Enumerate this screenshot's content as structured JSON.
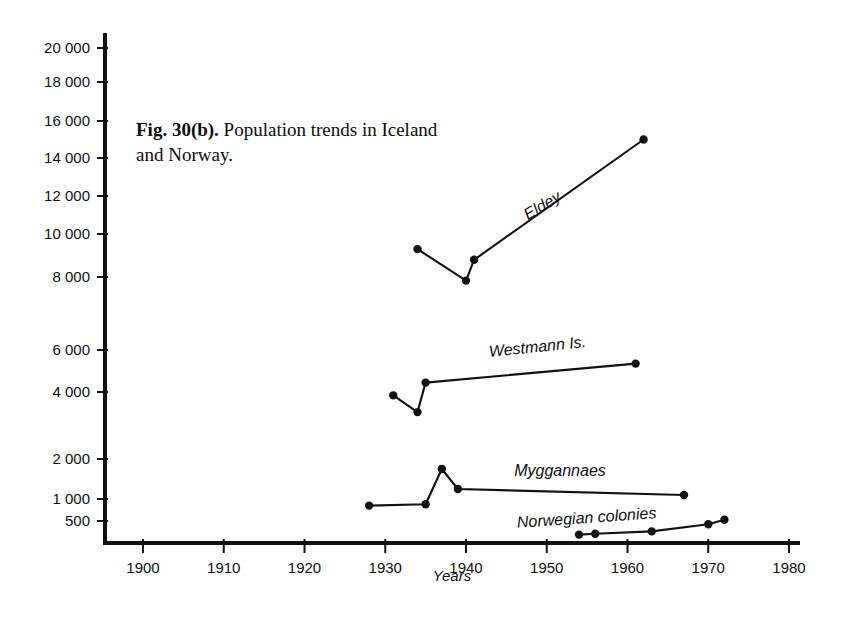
{
  "caption": {
    "figure_number": "Fig. 30(b).",
    "text": " Population trends in Iceland and Norway."
  },
  "chart_data": {
    "type": "line",
    "title": "Fig. 30(b). Population trends in Iceland and Norway.",
    "xlabel": "Years",
    "ylabel": "",
    "xlim": [
      1895,
      1980
    ],
    "ylim": [
      300,
      21000
    ],
    "grid": false,
    "legend": "inline-labels",
    "y_axis_note": "non-linear below 2 000 (500, 1 000, 2 000 compressed)",
    "xticks": [
      1900,
      1910,
      1920,
      1930,
      1940,
      1950,
      1960,
      1970,
      1980
    ],
    "xticklabels": [
      "1900",
      "1910",
      "1920",
      "1930",
      "1940",
      "1950",
      "1960",
      "1970",
      "1980"
    ],
    "yticks": [
      500,
      1000,
      2000,
      4000,
      6000,
      8000,
      10000,
      12000,
      14000,
      16000,
      18000,
      20000
    ],
    "yticklabels": [
      "500",
      "1 000",
      "2 000",
      "4 000",
      "6 000",
      "8 000",
      "10 000",
      "12 000",
      "14 000",
      "16 000",
      "18 000",
      "20 000"
    ],
    "series": [
      {
        "name": "Eldey",
        "label": "Eldey",
        "x": [
          1934,
          1940,
          1941,
          1962
        ],
        "y": [
          9300,
          7900,
          8800,
          15000
        ]
      },
      {
        "name": "Westmann Is.",
        "label": "Westmann Is.",
        "x": [
          1931,
          1934,
          1935,
          1961
        ],
        "y": [
          3900,
          3400,
          4450,
          5350
        ]
      },
      {
        "name": "Myggannaes",
        "label": "Myggannaes",
        "x": [
          1928,
          1935,
          1937,
          1939,
          1967
        ],
        "y": [
          850,
          880,
          1750,
          1250,
          1100
        ]
      },
      {
        "name": "Norwegian colonies",
        "label": "Norwegian colonies",
        "x": [
          1954,
          1956,
          1963,
          1970,
          1972
        ],
        "y": [
          330,
          340,
          370,
          460,
          530
        ]
      }
    ]
  }
}
